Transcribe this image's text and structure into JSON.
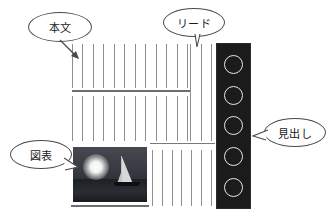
{
  "diagram": {
    "callouts": [
      {
        "id": "honbun",
        "label": "本文",
        "points_to": "body-text-block"
      },
      {
        "id": "lead",
        "label": "リード",
        "points_to": "lead-text-block"
      },
      {
        "id": "midashi",
        "label": "見出し",
        "points_to": "headline-bar"
      },
      {
        "id": "zuhyou",
        "label": "図表",
        "points_to": "photo-figure"
      }
    ],
    "page": {
      "body_text_upper_lines": 12,
      "body_text_lower_lines": 12,
      "lead_lines": 3,
      "bottom_right_lines": 7,
      "headline_circles": 5,
      "horizontal_rules": 3
    },
    "photo": {
      "caption": "sailboat at sea with moon",
      "elements": [
        "moon",
        "sea",
        "sailboat"
      ]
    },
    "colors": {
      "rule": "#7a7a7a",
      "text_line": "#8e8e8e",
      "headline_bar": "#1b1b1b",
      "circle_outline": "#e8e8e8",
      "bubble_outline": "#4a4a4a",
      "background": "#ffffff"
    }
  }
}
